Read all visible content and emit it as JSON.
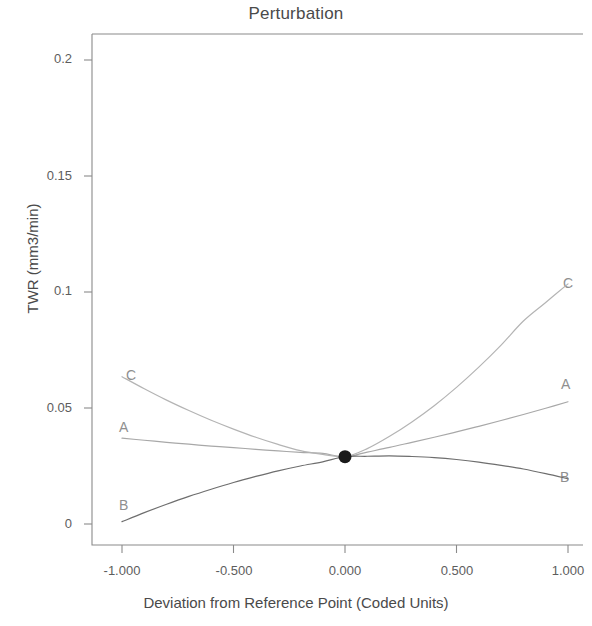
{
  "chart_data": {
    "type": "line",
    "title": "Perturbation",
    "xlabel": "Deviation from Reference Point (Coded Units)",
    "ylabel": "TWR (mm3/min)",
    "xlim": [
      -1.0,
      1.0
    ],
    "ylim": [
      0,
      0.215
    ],
    "grid": false,
    "legend": "inline-curve-labels",
    "xticks": [
      -1.0,
      -0.5,
      0.0,
      0.5,
      1.0
    ],
    "xtick_labels": [
      "-1.000",
      "-0.500",
      "0.000",
      "0.500",
      "1.000"
    ],
    "yticks": [
      0,
      0.05,
      0.1,
      0.15,
      0.2
    ],
    "ytick_labels": [
      "0",
      "0.05",
      "0.1",
      "0.15",
      "0.2"
    ],
    "reference_point": {
      "x": 0.0,
      "y": 0.029,
      "marker": "filled-circle"
    },
    "x": [
      -1.0,
      -0.9,
      -0.8,
      -0.7,
      -0.6,
      -0.5,
      -0.4,
      -0.3,
      -0.2,
      -0.1,
      0.0,
      0.1,
      0.2,
      0.3,
      0.4,
      0.5,
      0.6,
      0.7,
      0.8,
      0.9,
      1.0
    ],
    "series": [
      {
        "name": "A",
        "label": "A",
        "color": "#a8a8a8",
        "values": [
          0.037,
          0.0361,
          0.0352,
          0.0344,
          0.0336,
          0.0329,
          0.0322,
          0.0315,
          0.0309,
          0.0304,
          0.029,
          0.031,
          0.033,
          0.0352,
          0.0374,
          0.0397,
          0.0421,
          0.0446,
          0.0472,
          0.0499,
          0.0527
        ]
      },
      {
        "name": "B",
        "label": "B",
        "color": "#6e6e6e",
        "values": [
          0.001,
          0.0049,
          0.0085,
          0.0119,
          0.015,
          0.0179,
          0.0205,
          0.0229,
          0.025,
          0.0268,
          0.029,
          0.0292,
          0.0294,
          0.0291,
          0.0286,
          0.0278,
          0.0267,
          0.0253,
          0.0237,
          0.0217,
          0.0195
        ]
      },
      {
        "name": "C",
        "label": "C",
        "color": "#b4b4b4",
        "values": [
          0.0635,
          0.0583,
          0.0534,
          0.0489,
          0.0447,
          0.0409,
          0.0374,
          0.0343,
          0.0316,
          0.03,
          0.029,
          0.0325,
          0.0378,
          0.044,
          0.051,
          0.0589,
          0.0676,
          0.0771,
          0.0875,
          0.0955,
          0.1035
        ]
      }
    ],
    "curve_labels": [
      {
        "text": "C",
        "side": "left",
        "x": 126,
        "y": 367
      },
      {
        "text": "A",
        "side": "left",
        "x": 119,
        "y": 419
      },
      {
        "text": "B",
        "side": "left",
        "x": 119,
        "y": 497
      },
      {
        "text": "C",
        "side": "right",
        "x": 563,
        "y": 275
      },
      {
        "text": "A",
        "side": "right",
        "x": 561,
        "y": 376
      },
      {
        "text": "B",
        "side": "right",
        "x": 560,
        "y": 469
      }
    ],
    "axis_color": "#8a8a8a",
    "marker_color": "#1a1a1a"
  }
}
